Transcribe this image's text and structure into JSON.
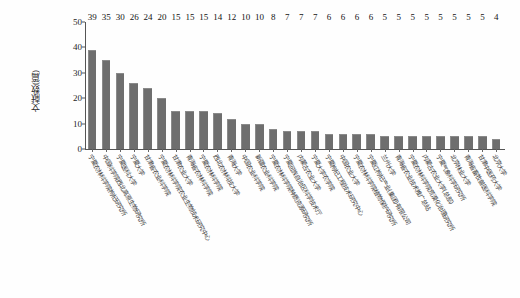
{
  "chart_data": {
    "type": "bar",
    "title": "",
    "xlabel": "",
    "ylabel": "文献数(篇)",
    "ylim": [
      0,
      50
    ],
    "yticks": [
      0,
      10,
      20,
      30,
      40,
      50
    ],
    "grid": false,
    "legend": null,
    "bar_color": "#6e6e6e",
    "label_rotation_deg": 60,
    "categories": [
      "宁夏农林科学院枸杞研究所",
      "中国科学院西北高原生物研究所",
      "宁夏医科大学",
      "宁夏大学",
      "甘肃省农业科学院",
      "宁夏农林科学院农业生物技术研究中心",
      "甘肃农业大学",
      "青海省农林科学院",
      "宁夏农林科学院",
      "西北农林科技大学",
      "青海大学",
      "中国农业科学院",
      "新疆农业科学院",
      "宁夏农林科学院种质资源研究所",
      "宁夏回族自治区科学技术厅",
      "内蒙古农业大学",
      "宁夏大学农学院",
      "宁夏枸杞工程技术研究中心",
      "中国农业大学",
      "宁夏农林科学院植物保护研究所",
      "宁夏红枸杞产业(集团)有限公司",
      "兰州大学",
      "青海省农业技术推广总站",
      "宁夏农林科学院荒漠化治理研究所",
      "内蒙古农业大学(总部)",
      "宁夏气象科学研究所",
      "北京林业大学",
      "青海省畜牧兽医科学院",
      "甘肃中医药大学",
      "北京大学"
    ],
    "values": [
      39,
      35,
      30,
      26,
      24,
      20,
      15,
      15,
      15,
      14,
      12,
      10,
      10,
      8,
      7,
      7,
      7,
      6,
      6,
      6,
      6,
      5,
      5,
      5,
      5,
      5,
      5,
      5,
      5,
      4
    ]
  }
}
